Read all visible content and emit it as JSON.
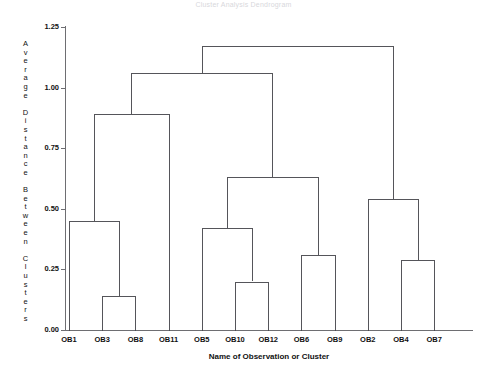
{
  "title": "Cluster Analysis Dendrogram",
  "axes": {
    "ylabel_text": "Average Distance Between Clusters",
    "ylabel_chars": [
      "A",
      "v",
      "e",
      "r",
      "a",
      "g",
      "e",
      "",
      "D",
      "i",
      "s",
      "t",
      "a",
      "n",
      "c",
      "e",
      "",
      "B",
      "e",
      "t",
      "w",
      "e",
      "e",
      "n",
      "",
      "C",
      "l",
      "u",
      "s",
      "t",
      "e",
      "r",
      "s"
    ],
    "xlabel": "Name of Observation or Cluster",
    "yticks": [
      "0.00",
      "0.25",
      "0.50",
      "0.75",
      "1.00",
      "1.25"
    ],
    "ytick_values": [
      0.0,
      0.25,
      0.5,
      0.75,
      1.0,
      1.25
    ],
    "ylim": [
      0.0,
      1.25
    ],
    "leaves": [
      "OB1",
      "OB3",
      "OB8",
      "OB11",
      "OB5",
      "OB10",
      "OB12",
      "OB6",
      "OB9",
      "OB2",
      "OB4",
      "OB7"
    ]
  },
  "colors": {
    "line": "#55555a",
    "axis": "#6e6e72",
    "text": "#111111",
    "background": "#ffffff"
  },
  "chart_data": {
    "type": "dendrogram",
    "title": "Cluster Analysis Dendrogram",
    "xlabel": "Name of Observation or Cluster",
    "ylabel": "Average Distance Between Clusters",
    "ylim": [
      0.0,
      1.25
    ],
    "yticks": [
      0.0,
      0.25,
      0.5,
      0.75,
      1.0,
      1.25
    ],
    "grid": false,
    "legend": "none",
    "leaf_order": [
      "OB1",
      "OB3",
      "OB8",
      "OB11",
      "OB5",
      "OB10",
      "OB12",
      "OB6",
      "OB9",
      "OB2",
      "OB4",
      "OB7"
    ],
    "merges": [
      {
        "id": "M1",
        "left": "OB3",
        "right": "OB8",
        "height": 0.14
      },
      {
        "id": "M2",
        "left": "OB10",
        "right": "OB12",
        "height": 0.2
      },
      {
        "id": "M3",
        "left": "OB4",
        "right": "OB7",
        "height": 0.29
      },
      {
        "id": "M4",
        "left": "OB6",
        "right": "OB9",
        "height": 0.31
      },
      {
        "id": "M5",
        "left": "OB5",
        "right": "M2",
        "height": 0.42
      },
      {
        "id": "M6",
        "left": "OB1",
        "right": "M1",
        "height": 0.45
      },
      {
        "id": "M7",
        "left": "OB2",
        "right": "M3",
        "height": 0.54
      },
      {
        "id": "M8",
        "left": "M5",
        "right": "M4",
        "height": 0.63
      },
      {
        "id": "M9",
        "left": "M6",
        "right": "OB11",
        "height": 0.89
      },
      {
        "id": "M10",
        "left": "M9",
        "right": "M8",
        "height": 1.06
      },
      {
        "id": "M11",
        "left": "M10",
        "right": "M7",
        "height": 1.17
      }
    ]
  }
}
